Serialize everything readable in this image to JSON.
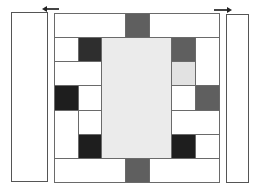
{
  "colors": {
    "white": "#ffffff",
    "light": "#ebebeb",
    "lighter": "#e2e2e2",
    "mid": "#5f5f5f",
    "dark": "#2e2e2e",
    "black": "#1e1e1e",
    "border": "#6a6a6a"
  },
  "side_panels": [
    {
      "name": "left-panel",
      "x": 11,
      "y": 12,
      "w": 37,
      "h": 170
    },
    {
      "name": "right-panel",
      "x": 226,
      "y": 14,
      "w": 23,
      "h": 169
    }
  ],
  "arrows": [
    {
      "name": "left-arrow",
      "direction": "left",
      "x": 46,
      "y": 8,
      "w": 13
    },
    {
      "name": "right-arrow",
      "direction": "right",
      "x": 214,
      "y": 9,
      "w": 14
    }
  ],
  "grid_cells": [
    {
      "x": 54,
      "y": 13,
      "w": 72,
      "h": 25,
      "fill": "white"
    },
    {
      "x": 125,
      "y": 13,
      "w": 25,
      "h": 25,
      "fill": "mid"
    },
    {
      "x": 149,
      "y": 13,
      "w": 71,
      "h": 25,
      "fill": "white"
    },
    {
      "x": 54,
      "y": 37,
      "w": 25,
      "h": 25,
      "fill": "white"
    },
    {
      "x": 78,
      "y": 37,
      "w": 24,
      "h": 25,
      "fill": "dark"
    },
    {
      "x": 101,
      "y": 37,
      "w": 71,
      "h": 122,
      "fill": "light"
    },
    {
      "x": 171,
      "y": 37,
      "w": 25,
      "h": 25,
      "fill": "mid"
    },
    {
      "x": 195,
      "y": 37,
      "w": 25,
      "h": 49,
      "fill": "white"
    },
    {
      "x": 54,
      "y": 61,
      "w": 48,
      "h": 25,
      "fill": "white"
    },
    {
      "x": 171,
      "y": 61,
      "w": 25,
      "h": 25,
      "fill": "lighter"
    },
    {
      "x": 54,
      "y": 85,
      "w": 25,
      "h": 26,
      "fill": "black"
    },
    {
      "x": 78,
      "y": 85,
      "w": 24,
      "h": 26,
      "fill": "white"
    },
    {
      "x": 171,
      "y": 85,
      "w": 25,
      "h": 26,
      "fill": "white"
    },
    {
      "x": 195,
      "y": 85,
      "w": 25,
      "h": 26,
      "fill": "mid"
    },
    {
      "x": 54,
      "y": 110,
      "w": 25,
      "h": 49,
      "fill": "white"
    },
    {
      "x": 78,
      "y": 110,
      "w": 24,
      "h": 25,
      "fill": "white"
    },
    {
      "x": 171,
      "y": 110,
      "w": 49,
      "h": 25,
      "fill": "white"
    },
    {
      "x": 78,
      "y": 134,
      "w": 24,
      "h": 25,
      "fill": "black"
    },
    {
      "x": 171,
      "y": 134,
      "w": 25,
      "h": 25,
      "fill": "black"
    },
    {
      "x": 195,
      "y": 134,
      "w": 25,
      "h": 25,
      "fill": "white"
    },
    {
      "x": 54,
      "y": 158,
      "w": 72,
      "h": 25,
      "fill": "white"
    },
    {
      "x": 125,
      "y": 158,
      "w": 25,
      "h": 25,
      "fill": "mid"
    },
    {
      "x": 149,
      "y": 158,
      "w": 71,
      "h": 25,
      "fill": "white"
    }
  ]
}
